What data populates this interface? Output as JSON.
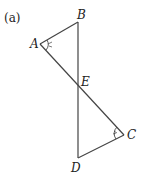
{
  "figure": {
    "panel_label": "(a)",
    "points": {
      "A": {
        "label": "A",
        "x": 40,
        "y": 44
      },
      "B": {
        "label": "B",
        "x": 78,
        "y": 22
      },
      "E": {
        "label": "E",
        "x": 78,
        "y": 87
      },
      "C": {
        "label": "C",
        "x": 124,
        "y": 135
      },
      "D": {
        "label": "D",
        "x": 78,
        "y": 158
      }
    },
    "segments": [
      "AB",
      "BD",
      "AC",
      "CD"
    ],
    "angle_marks": [
      "A",
      "C"
    ],
    "line_color": "#444444"
  }
}
